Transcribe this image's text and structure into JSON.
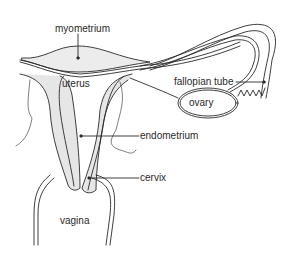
{
  "diagram": {
    "labels": {
      "myometrium": "myometrium",
      "uterus": "uterus",
      "fallopian_tube": "fallopian tube",
      "ovary": "ovary",
      "endometrium": "endometrium",
      "cervix": "cervix",
      "vagina": "vagina"
    },
    "colors": {
      "line": "#2a2a2a",
      "fill": "#e6e6e6",
      "background": "#ffffff"
    }
  }
}
